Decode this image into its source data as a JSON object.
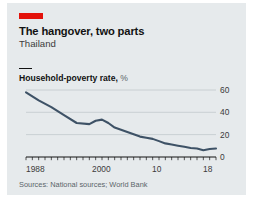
{
  "figure": {
    "marker_color": "#e3120b",
    "background": "#e6eaec",
    "title": "The hangover, two parts",
    "subtitle": "Thailand",
    "source": "Sources: National sources; World Bank"
  },
  "chart_data": {
    "type": "line",
    "title": "Household-poverty rate, %",
    "title_main": "Household-poverty rate,",
    "title_unit": "%",
    "xlabel": "",
    "ylabel": "%",
    "ylim": [
      0,
      60
    ],
    "xlim": [
      1988,
      2018
    ],
    "yticks": [
      60,
      40,
      20,
      0
    ],
    "ytick_labels": [
      "60",
      "40",
      "20",
      "0"
    ],
    "xticks": [
      1988,
      2000,
      2010,
      2018
    ],
    "xtick_labels": [
      "1988",
      "2000",
      "10",
      "18"
    ],
    "grid": true,
    "legend": "none",
    "line_color": "#3e5266",
    "series": [
      {
        "name": "Household-poverty rate",
        "x": [
          1988,
          1990,
          1992,
          1994,
          1996,
          1998,
          1999,
          2000,
          2001,
          2002,
          2004,
          2006,
          2007,
          2008,
          2009,
          2010,
          2011,
          2012,
          2013,
          2014,
          2015,
          2016,
          2017,
          2018
        ],
        "values": [
          57,
          50,
          44,
          37,
          30,
          29,
          32,
          33,
          30,
          26,
          22,
          18,
          17,
          16,
          14,
          12,
          11,
          10,
          9,
          8,
          7.5,
          6,
          7,
          7.5
        ]
      }
    ]
  },
  "axis_ticks": {
    "minor_count": 31
  }
}
